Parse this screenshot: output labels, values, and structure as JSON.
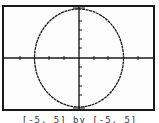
{
  "screen": {
    "type": "graphing-calculator-display",
    "equation_plotted": "circle",
    "window_caption": "[-5, 5] by [-5, 5]",
    "colors": {
      "frame": "#1a1a1a",
      "background": "#fdfdfd",
      "axis": "#1a1a1a",
      "curve": "#1a1a1a"
    }
  },
  "axes": {
    "x_ticks_each_side": 5,
    "y_ticks_each_side": 5
  }
}
